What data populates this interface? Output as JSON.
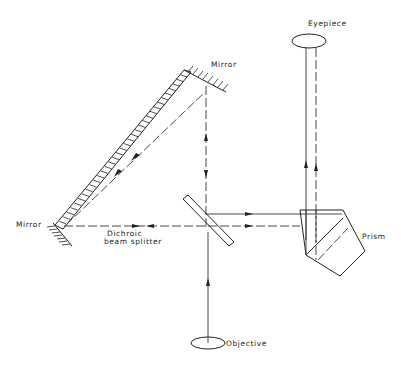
{
  "diagram": {
    "type": "optical-path",
    "labels": {
      "eyepiece": "Eyepiece",
      "mirror_top": "Mirror",
      "mirror_left": "Mirror",
      "dichroic_line1": "Dichroic",
      "dichroic_line2": "beam splitter",
      "prism": "Prism",
      "objective": "Objective"
    },
    "components": [
      "Eyepiece",
      "Mirror (top)",
      "Mirror (left)",
      "Dichroic beam splitter",
      "Prism",
      "Objective"
    ],
    "beams": [
      {
        "name": "objective-to-splitter",
        "style": "solid",
        "direction": "up"
      },
      {
        "name": "splitter-to-prism-solid",
        "style": "solid",
        "direction": "right"
      },
      {
        "name": "splitter-to-prism-dashed",
        "style": "dashed",
        "direction": "right"
      },
      {
        "name": "splitter-to-top-mirror",
        "style": "dashed",
        "direction": "both"
      },
      {
        "name": "top-mirror-to-left-mirror",
        "style": "dashed",
        "direction": "both"
      },
      {
        "name": "left-mirror-to-splitter",
        "style": "dashed",
        "direction": "both"
      },
      {
        "name": "prism-to-eyepiece-solid",
        "style": "solid",
        "direction": "up"
      },
      {
        "name": "prism-to-eyepiece-dashed",
        "style": "dashed",
        "direction": "up"
      }
    ]
  }
}
